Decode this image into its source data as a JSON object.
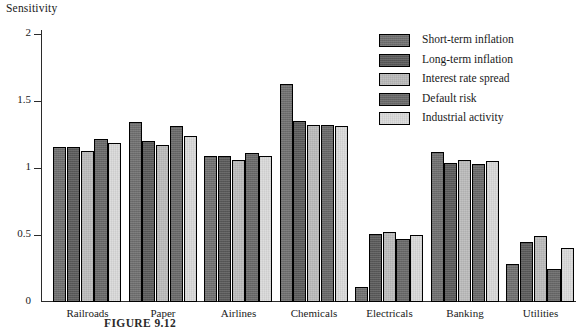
{
  "chart_data": {
    "type": "bar",
    "title": "",
    "ylabel": "Sensitivity",
    "xlabel": "",
    "ylim": [
      0,
      2
    ],
    "yticks": [
      0,
      0.5,
      1,
      1.5,
      2
    ],
    "ytick_labels": [
      "0",
      "0.5",
      "1",
      "1.5",
      "2"
    ],
    "grid": false,
    "legend_position": "upper right",
    "categories": [
      "Railroads",
      "Paper",
      "Airlines",
      "Chemicals",
      "Electricals",
      "Banking",
      "Utilities"
    ],
    "series": [
      {
        "name": "Short-term inflation",
        "color": "#6e6e6e",
        "values": [
          1.16,
          1.34,
          1.09,
          1.63,
          0.11,
          1.12,
          0.28
        ]
      },
      {
        "name": "Long-term inflation",
        "color": "#585858",
        "values": [
          1.16,
          1.2,
          1.09,
          1.35,
          0.51,
          1.04,
          0.45
        ]
      },
      {
        "name": "Interest rate spread",
        "color": "#b9b9b9",
        "values": [
          1.13,
          1.17,
          1.06,
          1.32,
          0.52,
          1.06,
          0.49
        ]
      },
      {
        "name": "Default risk",
        "color": "#676767",
        "values": [
          1.22,
          1.31,
          1.11,
          1.32,
          0.47,
          1.03,
          0.25
        ]
      },
      {
        "name": "Industrial activity",
        "color": "#d8d8d8",
        "values": [
          1.19,
          1.24,
          1.09,
          1.31,
          0.5,
          1.05,
          0.4
        ]
      }
    ]
  },
  "legend": {
    "items": [
      {
        "label": "Short-term inflation"
      },
      {
        "label": "Long-term inflation"
      },
      {
        "label": "Interest rate spread"
      },
      {
        "label": "Default risk"
      },
      {
        "label": "Industrial activity"
      }
    ]
  },
  "caption": {
    "text": "FIGURE 9.12"
  }
}
